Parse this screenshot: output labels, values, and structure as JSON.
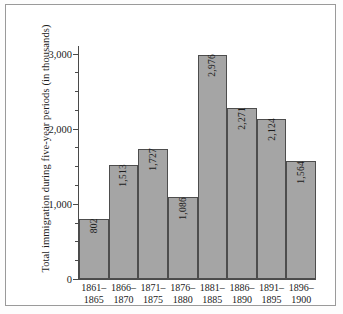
{
  "chart_data": {
    "type": "bar",
    "title": "",
    "subtitle": "",
    "xlabel": "",
    "ylabel": "Total immigration during five-year periods (in thousands)",
    "categories": [
      "1861–1865",
      "1866–1870",
      "1871–1875",
      "1876–1880",
      "1881–1885",
      "1886–1890",
      "1891–1895",
      "1896–1900"
    ],
    "category_lines": [
      {
        "line1": "1861–",
        "line2": "1865"
      },
      {
        "line1": "1866–",
        "line2": "1870"
      },
      {
        "line1": "1871–",
        "line2": "1875"
      },
      {
        "line1": "1876–",
        "line2": "1880"
      },
      {
        "line1": "1881–",
        "line2": "1885"
      },
      {
        "line1": "1886–",
        "line2": "1890"
      },
      {
        "line1": "1891–",
        "line2": "1895"
      },
      {
        "line1": "1896–",
        "line2": "1900"
      }
    ],
    "values": [
      802,
      1513,
      1727,
      1086,
      2976,
      2271,
      2124,
      1564
    ],
    "value_labels": [
      "802",
      "1,513",
      "1,727",
      "1,086",
      "2,976",
      "2,271",
      "2,124",
      "1,564"
    ],
    "ylim": [
      0,
      3100
    ],
    "yticks": [
      0,
      1000,
      2000,
      3000
    ],
    "ytick_labels": [
      "0",
      "1,000",
      "2,000",
      "3,000"
    ],
    "yminor_ticks": [
      250,
      500,
      750,
      1250,
      1500,
      1750,
      2250,
      2500,
      2750
    ],
    "grid": false,
    "legend": null,
    "legend_position": "none",
    "bar_color": "#a5a5a5",
    "bar_edge_color": "#4d4d4d",
    "axis_color": "#4a4a4a",
    "text_color": "#1c1c1c",
    "background_color": "#ffffff",
    "frame_color": "#9a9a9a"
  }
}
